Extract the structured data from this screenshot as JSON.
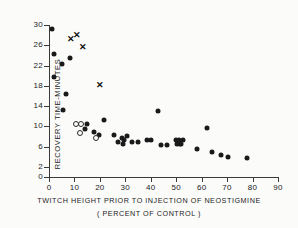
{
  "chart_data": {
    "type": "scatter",
    "title": "",
    "xlabel": "TWITCH HEIGHT PRIOR TO INJECTION OF NEOSTIGMINE",
    "xlabel_line2": "( PERCENT OF CONTROL )",
    "ylabel": "RECOVERY TIME-MINUTES",
    "xlim": [
      0,
      90
    ],
    "ylim": [
      0,
      30
    ],
    "grid": false,
    "legend": "none",
    "xticks": [
      0,
      10,
      20,
      30,
      40,
      50,
      60,
      70,
      80,
      90
    ],
    "xticklabels": [
      "0",
      "10",
      "20",
      "30",
      "40",
      "50",
      "60",
      "70",
      "80",
      "90"
    ],
    "yticks": [
      0,
      2,
      6,
      10,
      14,
      18,
      22,
      26,
      30
    ],
    "yticklabels": [
      "0",
      "2",
      "6",
      "10",
      "14",
      "18",
      "22",
      "26",
      "30"
    ],
    "series": [
      {
        "name": "filled-circle",
        "marker": "filled",
        "color": "#1a1a1a",
        "points": [
          [
            1.2,
            29.2
          ],
          [
            1.8,
            24.2
          ],
          [
            5.0,
            22.3
          ],
          [
            8.2,
            23.5
          ],
          [
            2.0,
            19.8
          ],
          [
            6.5,
            16.3
          ],
          [
            5.5,
            13.2
          ],
          [
            15.0,
            10.4
          ],
          [
            14.0,
            9.4
          ],
          [
            17.5,
            8.9
          ],
          [
            19.5,
            8.3
          ],
          [
            21.5,
            11.3
          ],
          [
            25.5,
            8.3
          ],
          [
            27.0,
            7.0
          ],
          [
            28.5,
            7.7
          ],
          [
            29.5,
            7.4
          ],
          [
            30.5,
            8.0
          ],
          [
            29.0,
            6.6
          ],
          [
            32.5,
            6.9
          ],
          [
            35.0,
            6.9
          ],
          [
            38.5,
            7.3
          ],
          [
            40.0,
            7.3
          ],
          [
            43.0,
            13.1
          ],
          [
            44.0,
            6.4
          ],
          [
            46.5,
            6.3
          ],
          [
            50.0,
            7.4
          ],
          [
            51.0,
            7.4
          ],
          [
            52.5,
            7.3
          ],
          [
            50.5,
            6.5
          ],
          [
            51.5,
            6.5
          ],
          [
            52.0,
            6.5
          ],
          [
            58.0,
            5.5
          ],
          [
            62.0,
            9.6
          ],
          [
            64.0,
            4.9
          ],
          [
            67.5,
            4.3
          ],
          [
            70.5,
            3.9
          ],
          [
            78.0,
            3.8
          ]
        ]
      },
      {
        "name": "open-circle",
        "marker": "open",
        "color": "#2a2a2a",
        "points": [
          [
            10.5,
            10.4
          ],
          [
            12.5,
            10.4
          ],
          [
            12.0,
            8.6
          ],
          [
            18.5,
            7.7
          ]
        ]
      },
      {
        "name": "cross",
        "marker": "cross",
        "color": "#111111",
        "points": [
          [
            8.5,
            27.3
          ],
          [
            11.0,
            28.0
          ],
          [
            13.5,
            25.7
          ],
          [
            20.0,
            18.1
          ]
        ]
      }
    ]
  }
}
